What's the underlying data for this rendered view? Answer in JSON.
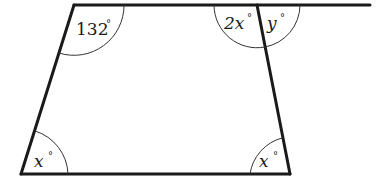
{
  "diagram": {
    "type": "trapezium-angles",
    "colors": {
      "line": "#1a1a1a",
      "arc": "#333333",
      "background": "#ffffff"
    },
    "vertices": {
      "top_left": [
        74,
        5
      ],
      "top_right": [
        257,
        5
      ],
      "bottom_left": [
        21,
        174
      ],
      "bottom_right": [
        290,
        174
      ]
    },
    "extended_line_end": [
      370,
      5
    ],
    "angles": [
      {
        "id": "top-left",
        "value": "132",
        "unit": "°",
        "variable": false
      },
      {
        "id": "top-right-interior",
        "value": "2x",
        "unit": "°",
        "variable": true
      },
      {
        "id": "top-right-exterior",
        "value": "y",
        "unit": "°",
        "variable": true
      },
      {
        "id": "bottom-left",
        "value": "x",
        "unit": "°",
        "variable": true
      },
      {
        "id": "bottom-right",
        "value": "x",
        "unit": "°",
        "variable": true
      }
    ]
  }
}
